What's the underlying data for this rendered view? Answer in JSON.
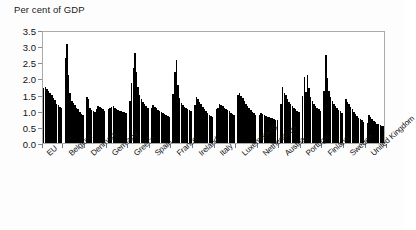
{
  "chart_data": {
    "type": "bar",
    "title": "Per cent of GDP",
    "subtitle": "",
    "xlabel": "",
    "ylabel": "Per cent of GDP",
    "ylim": [
      0.0,
      3.5
    ],
    "ytick_labels": [
      "0.0",
      "0.5",
      "1.0",
      "1.5",
      "2.0",
      "2.5",
      "3.0",
      "3.5"
    ],
    "ytick_values": [
      0.0,
      0.5,
      1.0,
      1.5,
      2.0,
      2.5,
      3.0,
      3.5
    ],
    "grid": false,
    "legend": "none",
    "bar_color": "#000000",
    "frame_color": "#aaaaaa",
    "categories": [
      "EU",
      "Belgium",
      "Denmark",
      "Germany",
      "Greece",
      "Spain",
      "France",
      "Ireland",
      "Italy",
      "Luxembourg",
      "Netherlands",
      "Austria",
      "Portugal",
      "Finland",
      "Sweden",
      "United Kingdom"
    ],
    "groups": [
      {
        "name": "EU",
        "values": [
          1.7,
          1.73,
          1.68,
          1.6,
          1.55,
          1.48,
          1.4,
          1.32,
          1.22,
          1.18,
          1.12,
          1.1
        ]
      },
      {
        "name": "Belgium",
        "values": [
          2.62,
          3.06,
          2.1,
          1.55,
          1.3,
          1.25,
          1.18,
          1.1,
          1.05,
          0.95,
          0.9,
          0.88
        ]
      },
      {
        "name": "Denmark",
        "values": [
          1.42,
          1.35,
          1.1,
          1.02,
          0.98,
          0.95,
          1.05,
          1.15,
          1.12,
          1.08,
          1.04,
          1.0
        ]
      },
      {
        "name": "Germany",
        "values": [
          1.05,
          1.08,
          1.12,
          1.15,
          1.1,
          1.06,
          1.02,
          1.0,
          0.98,
          0.96,
          0.95,
          0.92
        ]
      },
      {
        "name": "Greece",
        "values": [
          1.3,
          1.85,
          2.32,
          2.78,
          2.2,
          1.72,
          1.48,
          1.35,
          1.28,
          1.2,
          1.14,
          1.1
        ]
      },
      {
        "name": "Spain",
        "values": [
          1.1,
          1.18,
          1.12,
          1.08,
          1.02,
          0.98,
          0.95,
          0.92,
          0.9,
          0.88,
          0.85,
          0.82
        ]
      },
      {
        "name": "France",
        "values": [
          1.52,
          2.2,
          2.58,
          1.8,
          1.4,
          1.25,
          1.18,
          1.12,
          1.08,
          1.05,
          1.02,
          1.0
        ]
      },
      {
        "name": "Ireland",
        "values": [
          1.18,
          1.42,
          1.35,
          1.28,
          1.2,
          1.12,
          1.05,
          0.98,
          0.92,
          0.88,
          0.84,
          0.8
        ]
      },
      {
        "name": "Italy",
        "values": [
          1.05,
          1.1,
          1.22,
          1.18,
          1.14,
          1.1,
          1.06,
          1.02,
          0.98,
          0.94,
          0.9,
          0.86
        ]
      },
      {
        "name": "Luxembourg",
        "values": [
          1.48,
          1.55,
          1.45,
          1.38,
          1.3,
          1.22,
          1.15,
          1.08,
          1.02,
          0.96,
          0.92,
          0.88
        ]
      },
      {
        "name": "Netherlands",
        "values": [
          0.88,
          0.92,
          0.9,
          0.86,
          0.84,
          0.82,
          0.8,
          0.78,
          0.76,
          0.74,
          0.72,
          0.7
        ]
      },
      {
        "name": "Austria",
        "values": [
          1.2,
          1.72,
          1.55,
          1.48,
          1.35,
          1.28,
          1.22,
          1.16,
          1.1,
          1.05,
          1.0,
          0.96
        ]
      },
      {
        "name": "Portugal",
        "values": [
          1.45,
          2.06,
          1.58,
          2.12,
          1.7,
          1.42,
          1.3,
          1.22,
          1.15,
          1.1,
          1.05,
          1.0
        ]
      },
      {
        "name": "Finland",
        "values": [
          1.6,
          2.72,
          2.0,
          1.62,
          1.42,
          1.3,
          1.22,
          1.15,
          1.08,
          1.02,
          0.98,
          0.94
        ]
      },
      {
        "name": "Sweden",
        "values": [
          1.35,
          1.28,
          1.2,
          1.12,
          1.04,
          0.96,
          0.9,
          0.84,
          0.78,
          0.74,
          0.7,
          0.66
        ]
      },
      {
        "name": "United Kingdom",
        "values": [
          0.62,
          0.88,
          0.8,
          0.74,
          0.68,
          0.64,
          0.6,
          0.58,
          0.56,
          0.54,
          0.52,
          0.5
        ]
      }
    ]
  }
}
